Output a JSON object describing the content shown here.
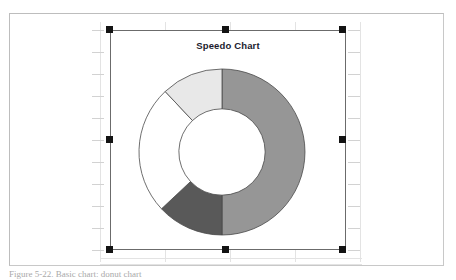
{
  "document": {
    "caption": "Figure 5-22. Basic chart: donut chart",
    "background_color": "#ffffff",
    "border_color": "#c8c8c8"
  },
  "chart_object": {
    "selected": true,
    "selection_handle_color": "#131313",
    "frame_border_color": "#6b6b6b",
    "handles": [
      {
        "name": "handle-top-left",
        "position": "top-left"
      },
      {
        "name": "handle-top-center",
        "position": "top-center"
      },
      {
        "name": "handle-top-right",
        "position": "top-right"
      },
      {
        "name": "handle-middle-left",
        "position": "middle-left"
      },
      {
        "name": "handle-middle-right",
        "position": "middle-right"
      },
      {
        "name": "handle-bottom-left",
        "position": "bottom-left"
      },
      {
        "name": "handle-bottom-center",
        "position": "bottom-center"
      },
      {
        "name": "handle-bottom-right",
        "position": "bottom-right"
      }
    ]
  },
  "chart_data": {
    "type": "pie",
    "variant": "donut",
    "title": "Speedo Chart",
    "subtitle": "",
    "xlabel": "",
    "ylabel": "",
    "legend": false,
    "legend_position": "none",
    "grid": false,
    "start_angle_deg": 0,
    "direction": "clockwise",
    "inner_radius_ratio": 0.52,
    "categories": [
      "Segment 1",
      "Segment 2",
      "Segment 3",
      "Segment 4"
    ],
    "values": [
      50,
      13,
      25,
      12
    ],
    "units": "percent",
    "total": 100,
    "slice_angles_deg": [
      180,
      46.8,
      90,
      43.2
    ],
    "colors": [
      "#969696",
      "#595959",
      "#ffffff",
      "#e8e8e8"
    ],
    "slice_border_color": "#4a4a4a",
    "slices": [
      {
        "label": "Segment 1",
        "value": 50,
        "color": "#969696",
        "start_deg": 0,
        "end_deg": 180
      },
      {
        "label": "Segment 2",
        "value": 13,
        "color": "#595959",
        "start_deg": 180,
        "end_deg": 226.8
      },
      {
        "label": "Segment 3",
        "value": 25,
        "color": "#ffffff",
        "start_deg": 226.8,
        "end_deg": 316.8
      },
      {
        "label": "Segment 4",
        "value": 12,
        "color": "#e8e8e8",
        "start_deg": 316.8,
        "end_deg": 360
      }
    ]
  }
}
